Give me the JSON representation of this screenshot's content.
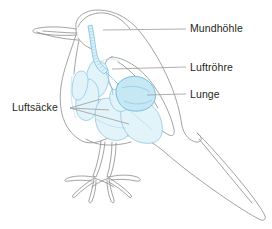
{
  "diagram": {
    "background_color": "#ffffff",
    "colors": {
      "body_outline": "#8c8c8c",
      "leader_line": "#9a9a9a",
      "organ_outline": "#79bfdd",
      "airsac_fill": "#e3f3fa",
      "airsac_outline": "#8cc9e3",
      "lung_fill": "#c6e7f4",
      "lung_outline": "#6fb8d8",
      "trachea_outline": "#7cc1de",
      "trachea_fill": "#dcf0f8",
      "label_text": "#231f20"
    },
    "labels": [
      {
        "id": "mundhoehle",
        "text": "Mundhöhle",
        "english": "oral cavity",
        "side": "right",
        "leader": {
          "x1": 186,
          "y1": 29,
          "x2": 103,
          "y2": 30
        }
      },
      {
        "id": "luftroehre",
        "text": "Luftröhre",
        "english": "trachea",
        "side": "right",
        "leader": {
          "x1": 186,
          "y1": 67,
          "x2": 112,
          "y2": 69
        }
      },
      {
        "id": "lunge",
        "text": "Lunge",
        "english": "lung",
        "side": "right",
        "leader": {
          "x1": 186,
          "y1": 94,
          "x2": 147,
          "y2": 95
        }
      },
      {
        "id": "luftsaecke",
        "text": "Luftsäcke",
        "english": "air sacs",
        "side": "left",
        "leader_origin": {
          "x": 70,
          "y": 108
        },
        "leader_targets": [
          {
            "x": 101,
            "y": 99
          },
          {
            "x": 109,
            "y": 110
          },
          {
            "x": 129,
            "y": 124
          }
        ]
      }
    ],
    "organs": [
      {
        "id": "trachea",
        "name": "Luftröhre",
        "style": "ringed-tube"
      },
      {
        "id": "lung",
        "name": "Lunge",
        "style": "solid-lobe"
      },
      {
        "id": "air-sacs",
        "name": "Luftsäcke",
        "style": "pale-lobes",
        "count": 6
      }
    ],
    "anatomy_parts": [
      "beak",
      "head",
      "neck",
      "body",
      "wing",
      "tail",
      "leg-left",
      "leg-right",
      "foot-left",
      "foot-right"
    ]
  }
}
